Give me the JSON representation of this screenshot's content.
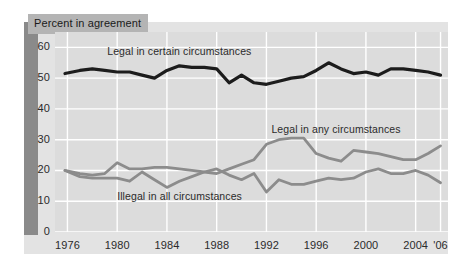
{
  "chart_data": {
    "type": "line",
    "title": "Percent in agreement",
    "xlabel": "",
    "ylabel": "",
    "xlim": [
      1975,
      2006.6
    ],
    "ylim": [
      0,
      65
    ],
    "grid": true,
    "legend_position": "inline-annotations",
    "ytick_labels": [
      "0",
      "10",
      "20",
      "30",
      "40",
      "50",
      "60"
    ],
    "ytick_values": [
      0,
      10,
      20,
      30,
      40,
      50,
      60
    ],
    "xtick_labels": [
      "1976",
      "1980",
      "1984",
      "1988",
      "1992",
      "1996",
      "2000",
      "2004",
      "'06"
    ],
    "xtick_values": [
      1976,
      1980,
      1984,
      1988,
      1992,
      1996,
      2000,
      2004,
      2006
    ],
    "colors": {
      "legal_certain": "#1c1c1c",
      "legal_any": "#8c8c8c",
      "illegal_all": "#8c8c8c",
      "plot_background": "#dcdcdc",
      "panel_background": "#e3e3e3",
      "gridline": "#ffffff",
      "title_box": "#b4b4b4",
      "left_band": "#8a8a8a"
    },
    "annotations": [
      {
        "text": "Legal in certain circumstances",
        "x": 1979.2,
        "y": 58.5
      },
      {
        "text": "Legal in any circumstances",
        "x": 1992.4,
        "y": 33.0
      },
      {
        "text": "Illegal in all circumstances",
        "x": 1980.0,
        "y": 11.5
      }
    ],
    "series": [
      {
        "name": "Legal in certain circumstances",
        "color": "#1c1c1c",
        "x": [
          1975.8,
          1977,
          1978,
          1979,
          1980,
          1981,
          1982,
          1983,
          1984,
          1985,
          1986,
          1987,
          1988,
          1989,
          1990,
          1991,
          1992,
          1993,
          1994,
          1995,
          1996,
          1997,
          1998,
          1999,
          2000,
          2001,
          2002,
          2003,
          2004,
          2005,
          2006
        ],
        "values": [
          51.5,
          52.5,
          53.0,
          52.5,
          52.0,
          52.0,
          51.0,
          50.0,
          52.5,
          54.0,
          53.5,
          53.5,
          53.0,
          48.5,
          51.0,
          48.5,
          48.0,
          49.0,
          50.0,
          50.5,
          52.5,
          55.0,
          53.0,
          51.5,
          52.0,
          51.0,
          53.0,
          53.0,
          52.5,
          52.0,
          51.0
        ]
      },
      {
        "name": "Legal in any circumstances",
        "color": "#8c8c8c",
        "x": [
          1975.8,
          1977,
          1978,
          1979,
          1980,
          1981,
          1982,
          1983,
          1984,
          1985,
          1986,
          1987,
          1988,
          1989,
          1990,
          1991,
          1992,
          1993,
          1994,
          1995,
          1996,
          1997,
          1998,
          1999,
          2000,
          2001,
          2002,
          2003,
          2004,
          2005,
          2006
        ],
        "values": [
          20.0,
          19.0,
          18.5,
          19.0,
          22.5,
          20.5,
          20.5,
          21.0,
          21.0,
          20.5,
          20.0,
          19.5,
          19.0,
          20.5,
          22.0,
          23.5,
          28.5,
          30.0,
          30.5,
          30.5,
          25.5,
          24.0,
          23.0,
          26.5,
          26.0,
          25.5,
          24.5,
          23.5,
          23.5,
          25.5,
          28.0
        ]
      },
      {
        "name": "Illegal in all circumstances",
        "color": "#8c8c8c",
        "x": [
          1975.8,
          1977,
          1978,
          1979,
          1980,
          1981,
          1982,
          1983,
          1984,
          1985,
          1986,
          1987,
          1988,
          1989,
          1990,
          1991,
          1992,
          1993,
          1994,
          1995,
          1996,
          1997,
          1998,
          1999,
          2000,
          2001,
          2002,
          2003,
          2004,
          2005,
          2006
        ],
        "values": [
          20.0,
          18.0,
          17.5,
          17.5,
          17.5,
          16.5,
          19.5,
          17.0,
          14.5,
          16.5,
          18.0,
          19.5,
          20.5,
          18.5,
          17.0,
          19.0,
          13.0,
          17.0,
          15.5,
          15.5,
          16.5,
          17.5,
          17.0,
          17.5,
          19.5,
          20.5,
          19.0,
          19.0,
          20.0,
          18.5,
          16.0
        ]
      }
    ]
  }
}
